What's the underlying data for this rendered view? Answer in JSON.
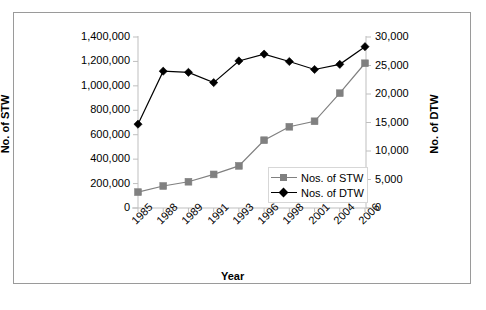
{
  "chart_data": {
    "type": "line",
    "title": "",
    "xlabel": "Year",
    "categories": [
      "1985",
      "1988",
      "1989",
      "1991",
      "1993",
      "1996",
      "1998",
      "2001",
      "2004",
      "2006"
    ],
    "series": [
      {
        "name": "Nos. of STW",
        "axis": "left",
        "color": "#808080",
        "marker": "square",
        "values": [
          130000,
          180000,
          215000,
          275000,
          345000,
          555000,
          665000,
          710000,
          940000,
          1185000
        ]
      },
      {
        "name": "Nos. of DTW",
        "axis": "right",
        "color": "#000000",
        "marker": "diamond",
        "values": [
          14700,
          24000,
          23800,
          22000,
          25800,
          27000,
          25700,
          24300,
          25200,
          28300
        ]
      }
    ],
    "axes": {
      "left": {
        "label": "No. of STW",
        "ylim": [
          0,
          1400000
        ],
        "ticks": [
          0,
          200000,
          400000,
          600000,
          800000,
          1000000,
          1200000,
          1400000
        ],
        "tick_labels": [
          "0",
          "200,000",
          "400,000",
          "600,000",
          "800,000",
          "1,000,000",
          "1,200,000",
          "1,400,000"
        ]
      },
      "right": {
        "label": "No. of DTW",
        "ylim": [
          0,
          30000
        ],
        "ticks": [
          0,
          5000,
          10000,
          15000,
          20000,
          25000,
          30000
        ],
        "tick_labels": [
          "0",
          "5,000",
          "10,000",
          "15,000",
          "20,000",
          "25,000",
          "30,000"
        ]
      }
    },
    "grid": false,
    "legend_position": "inside-bottom-right",
    "legend": [
      "Nos. of STW",
      "Nos. of DTW"
    ]
  },
  "colors": {
    "stw": "#808080",
    "dtw": "#000000",
    "frame": "#9a9a9a",
    "axis": "#bfbfbf",
    "background": "#ffffff"
  }
}
